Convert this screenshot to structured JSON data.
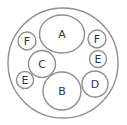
{
  "diagram": {
    "type": "nested-circles",
    "stroke_color": "#8f8f8f",
    "outer": {
      "cx": 63,
      "cy": 63,
      "r": 55
    },
    "circles": [
      {
        "label": "A",
        "cx": 62,
        "cy": 34,
        "rx": 22.5,
        "ry": 19
      },
      {
        "label": "F",
        "cx": 27,
        "cy": 41,
        "rx": 9,
        "ry": 9
      },
      {
        "label": "F",
        "cx": 97,
        "cy": 39,
        "rx": 9,
        "ry": 9
      },
      {
        "label": "E",
        "cx": 98,
        "cy": 59,
        "rx": 8.5,
        "ry": 8.5
      },
      {
        "label": "C",
        "cx": 42,
        "cy": 64,
        "rx": 13.5,
        "ry": 13.5
      },
      {
        "label": "E",
        "cx": 25,
        "cy": 80,
        "rx": 8.5,
        "ry": 8.5
      },
      {
        "label": "B",
        "cx": 62,
        "cy": 91,
        "rx": 19,
        "ry": 19
      },
      {
        "label": "D",
        "cx": 95,
        "cy": 84,
        "rx": 13,
        "ry": 13
      }
    ]
  }
}
